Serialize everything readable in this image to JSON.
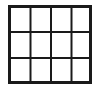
{
  "icon": {
    "name": "grid-icon",
    "columns": 4,
    "rows": 3,
    "stroke_color": "#1a1a1a",
    "background_color": "#ffffff"
  }
}
